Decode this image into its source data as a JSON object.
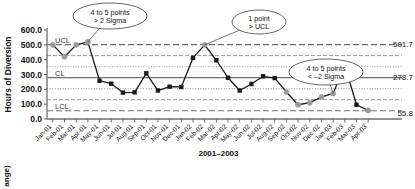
{
  "chart_data": {
    "type": "line",
    "title": "",
    "xlabel": "2001–2003",
    "ylabel": "Hours of Diversion",
    "ylim": [
      0,
      600
    ],
    "yticks": [
      "0.0",
      "100.0",
      "200.0",
      "300.0",
      "400.0",
      "500.0",
      "600.0"
    ],
    "grid": false,
    "categories": [
      "Jan-01",
      "Feb-01",
      "Mar-01",
      "Apr-01",
      "May-01",
      "Jun-01",
      "Jul-01",
      "Aug-01",
      "Sep-01",
      "Oct-01",
      "Nov-01",
      "Dec-01",
      "Jan-02",
      "Feb-02",
      "Mar-02",
      "Apr-02",
      "May-02",
      "Jun-02",
      "Jul-02",
      "Aug-02",
      "Sep-02",
      "Oct-02",
      "Nov-02",
      "Dec-02",
      "Jan-03",
      "Feb-03",
      "Mar-03",
      "Apr-03"
    ],
    "series": [
      {
        "name": "Hours of Diversion",
        "values": [
          500,
          420,
          500,
          520,
          258,
          238,
          178,
          180,
          308,
          192,
          218,
          216,
          412,
          500,
          396,
          278,
          192,
          236,
          288,
          276,
          182,
          96,
          110,
          148,
          172,
          362,
          96,
          58
        ],
        "point_status": [
          "out",
          "out",
          "out",
          "out",
          "in",
          "in",
          "in",
          "in",
          "in",
          "in",
          "in",
          "in",
          "in",
          "out",
          "in",
          "in",
          "in",
          "in",
          "in",
          "in",
          "out",
          "out",
          "out",
          "out",
          "out",
          "out",
          "in",
          "out"
        ]
      }
    ],
    "control_limits": {
      "ucl": {
        "label": "UCL",
        "value": 501.7,
        "value_label": "501.7",
        "style": "dashed"
      },
      "cl": {
        "label": "CL",
        "value": 278.7,
        "value_label": "278.7",
        "style": "solid"
      },
      "lcl": {
        "label": "LCL",
        "value": 55.8,
        "value_label": "55.8",
        "style": "dashed"
      },
      "plus_two_sigma": {
        "value": 427.4,
        "style": "dashed-light"
      },
      "minus_two_sigma": {
        "value": 130.1,
        "style": "dashed-light"
      },
      "plus_one_sigma": {
        "value": 353.0,
        "style": "dotted"
      },
      "minus_one_sigma": {
        "value": 204.4,
        "style": "dotted"
      }
    },
    "annotations": [
      {
        "id": "rule-two-sigma-high",
        "line1": "4 to 5 points",
        "line2": "> 2 Sigma",
        "target_category": "Apr-01"
      },
      {
        "id": "rule-one-point-above-ucl",
        "line1": "1 point",
        "line2": "> UCL",
        "target_category": "Feb-02"
      },
      {
        "id": "rule-two-sigma-low",
        "line1": "4 to 5 points",
        "line2": "< –2 Sigma",
        "target_category": "Jan-03"
      }
    ],
    "colors": {
      "line": "#1a1a1a",
      "marker_in_control": "#1a1a1a",
      "marker_out_of_control": "#9a9a9a",
      "control_line": "#6e6e6e",
      "axis": "#6e6e6e"
    }
  },
  "footer": {
    "partial_caption": "ange)"
  }
}
